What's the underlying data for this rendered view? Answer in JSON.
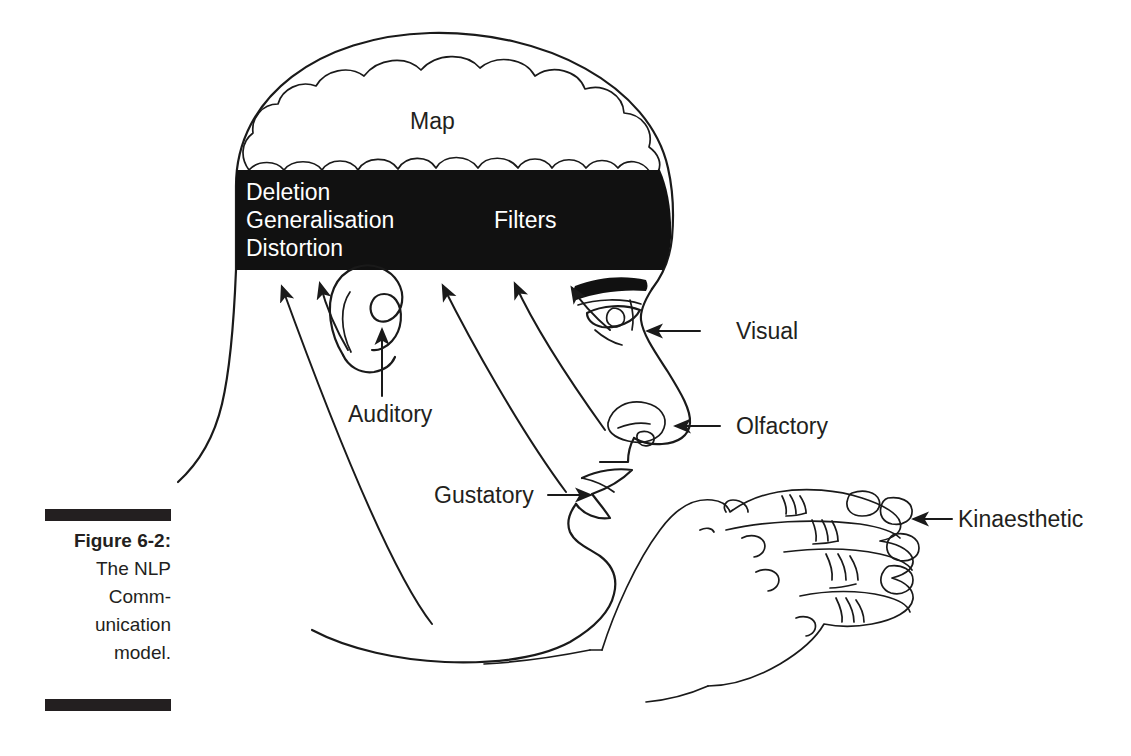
{
  "figure": {
    "caption_number": "Figure 6-2:",
    "caption_lines": [
      "The NLP",
      "Comm-",
      "unication",
      "model."
    ],
    "full_caption": "Figure 6-2: The NLP Communication model."
  },
  "diagram": {
    "map_label": "Map",
    "filters_label": "Filters",
    "filter_items": [
      "Deletion",
      "Generalisation",
      "Distortion"
    ],
    "senses": [
      {
        "id": "visual",
        "label": "Visual"
      },
      {
        "id": "auditory",
        "label": "Auditory"
      },
      {
        "id": "olfactory",
        "label": "Olfactory"
      },
      {
        "id": "gustatory",
        "label": "Gustatory"
      },
      {
        "id": "kinaesthetic",
        "label": "Kinaesthetic"
      }
    ]
  },
  "colors": {
    "ink": "#1a1a1a",
    "band_fill": "#111111",
    "band_text": "#ffffff",
    "paper": "#ffffff",
    "caption_text": "#231f20"
  }
}
